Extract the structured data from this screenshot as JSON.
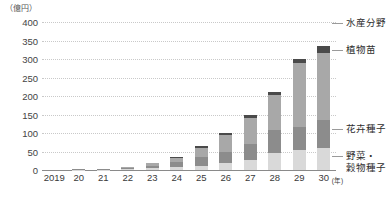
{
  "axis": {
    "unit_caption": "（億円）",
    "x_unit": "(年)",
    "y_ticks": [
      "400",
      "350",
      "300",
      "250",
      "200",
      "150",
      "100",
      "50",
      "0"
    ],
    "x_labels": [
      "2019",
      "20",
      "21",
      "22",
      "23",
      "24",
      "25",
      "26",
      "27",
      "28",
      "29",
      "30"
    ]
  },
  "callouts": [
    {
      "key": "fisheries",
      "label": "水産分野"
    },
    {
      "key": "seedlings",
      "label": "植物苗"
    },
    {
      "key": "flower",
      "label": "花卉種子"
    },
    {
      "key": "vegetable_line1",
      "label": "野菜・"
    },
    {
      "key": "vegetable_line2",
      "label": "穀物種子"
    }
  ],
  "colors": {
    "vegetable_grain_seed": "#d9d9d9",
    "flower_seed": "#8c8c8c",
    "plant_seedling": "#a8a8a8",
    "fisheries": "#4a4a4a",
    "gridline": "#c9c9c9",
    "axis": "#8a8a8a",
    "text": "#3a3a3a"
  },
  "chart_data": {
    "type": "bar",
    "title": "",
    "subtitle": "",
    "xlabel": "(年)",
    "ylabel": "（億円）",
    "ylim": [
      0,
      400
    ],
    "ytick_step": 50,
    "grid": true,
    "stacked": true,
    "legend_position": "right-callouts",
    "categories": [
      "2019",
      "20",
      "21",
      "22",
      "23",
      "24",
      "25",
      "26",
      "27",
      "28",
      "29",
      "30"
    ],
    "series": [
      {
        "name": "野菜・穀物種子",
        "values": [
          0,
          1,
          1,
          3,
          5,
          8,
          12,
          18,
          28,
          45,
          55,
          60
        ]
      },
      {
        "name": "花卉種子",
        "values": [
          0,
          1,
          1,
          3,
          7,
          14,
          22,
          30,
          42,
          62,
          60,
          75
        ]
      },
      {
        "name": "植物苗",
        "values": [
          0,
          1,
          1,
          2,
          6,
          10,
          25,
          48,
          70,
          95,
          175,
          180
        ]
      },
      {
        "name": "水産分野",
        "values": [
          0,
          0,
          0,
          0,
          0,
          3,
          5,
          4,
          10,
          8,
          10,
          20
        ]
      }
    ],
    "totals": [
      0,
      3,
      3,
      8,
      18,
      35,
      64,
      100,
      150,
      210,
      300,
      335
    ]
  }
}
